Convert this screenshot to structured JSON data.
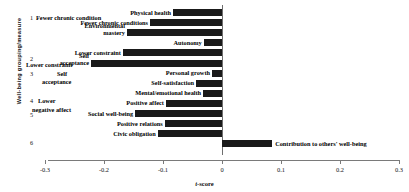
{
  "chart_data": {
    "type": "bar",
    "orientation": "horizontal",
    "title": "",
    "xlabel": "t -score",
    "ylabel": "Well-being grouping/measure",
    "xlim": [
      -0.3,
      0.3
    ],
    "xticks": [
      "-0.3",
      "-0.2",
      "-0.1",
      "0",
      "0.1",
      "0.2",
      "0.3"
    ],
    "xtickvalues": [
      -0.3,
      -0.2,
      -0.1,
      0,
      0.1,
      0.2,
      0.3
    ],
    "grid": false,
    "legend": "none",
    "categories": [
      "Physical health",
      "Fewer chronic conditions",
      "Environmental mastery",
      "Autonomy",
      "Lower constraint",
      "Self acceptance",
      "Personal growth",
      "Self-satisfaction",
      "Mental/emotional health",
      "Positive affect",
      "Social well-being",
      "Positive relations",
      "Civic obligation",
      "Contribution to others' well-being"
    ],
    "values": [
      -0.083,
      -0.122,
      -0.161,
      -0.031,
      -0.168,
      -0.222,
      -0.017,
      -0.044,
      -0.032,
      -0.095,
      -0.147,
      -0.097,
      -0.109,
      0.085
    ],
    "groups": [
      {
        "number": "1",
        "label": "Fewer chronic conditions"
      },
      {
        "number": "2",
        "label": "Lower constraint"
      },
      {
        "number": "3",
        "label": "Self acceptance"
      },
      {
        "number": "4",
        "label": "Lower negative affect"
      },
      {
        "number": "5",
        "label": ""
      },
      {
        "number": "6",
        "label": ""
      }
    ],
    "group_numbers": [
      "1",
      "2",
      "3",
      "4",
      "5",
      "6"
    ],
    "bar_color": "#1a1a1a"
  },
  "axis": {
    "ylabel": "Well-being grouping/measure",
    "xlabel_italic": "t",
    "xlabel_rest": "-score"
  },
  "bars": [
    {
      "label": "Physical health",
      "value": -0.083,
      "label_side": "left"
    },
    {
      "label": "Fewer chronic conditions",
      "value": -0.122,
      "label_side": "left"
    },
    {
      "label": "Environmental",
      "value": -0.161,
      "label_side": "left",
      "label2": "mastery"
    },
    {
      "label": "Autonomy",
      "value": -0.031,
      "label_side": "left"
    },
    {
      "label": "Lower constraint",
      "value": -0.168,
      "label_side": "left"
    },
    {
      "label": "Self",
      "value": -0.222,
      "label_side": "left",
      "label2": "acceptance"
    },
    {
      "label": "Personal growth",
      "value": -0.017,
      "label_side": "left"
    },
    {
      "label": "Self-satisfaction",
      "value": -0.044,
      "label_side": "left"
    },
    {
      "label": "Mental/emotional health",
      "value": -0.032,
      "label_side": "left"
    },
    {
      "label": "Positive affect",
      "value": -0.095,
      "label_side": "left"
    },
    {
      "label": "Social well-being",
      "value": -0.147,
      "label_side": "left"
    },
    {
      "label": "Positive relations",
      "value": -0.097,
      "label_side": "left"
    },
    {
      "label": "Civic obligation",
      "value": -0.109,
      "label_side": "left"
    },
    {
      "label": "Contribution to others' well-being",
      "value": 0.085,
      "label_side": "right"
    }
  ],
  "group_labels": [
    {
      "num": "1",
      "text": "Fewer chronic condition"
    },
    {
      "num": "2",
      "text": "Lower constraint"
    },
    {
      "num": "3",
      "text": ""
    },
    {
      "num": "4",
      "text": "Lower"
    },
    {
      "num": "5",
      "text": ""
    },
    {
      "num": "6",
      "text": ""
    }
  ],
  "ticks": [
    {
      "label": "-0.3",
      "value": -0.3
    },
    {
      "label": "-0.2",
      "value": -0.2
    },
    {
      "label": "-0.1",
      "value": -0.1
    },
    {
      "label": "0",
      "value": 0
    },
    {
      "label": "0.1",
      "value": 0.1
    },
    {
      "label": "0.2",
      "value": 0.2
    },
    {
      "label": "0.3",
      "value": 0.3
    }
  ]
}
